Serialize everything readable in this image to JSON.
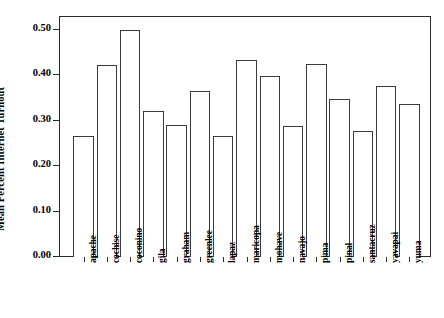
{
  "chart_data": {
    "type": "bar",
    "title": "",
    "xlabel": "",
    "ylabel": "Mean Percent Internet Turnout",
    "ylim": [
      0.0,
      0.53
    ],
    "yticks": [
      "0.00",
      "0.10",
      "0.20",
      "0.30",
      "0.40",
      "0.50"
    ],
    "ytick_values": [
      0.0,
      0.1,
      0.2,
      0.3,
      0.4,
      0.5
    ],
    "grid": false,
    "legend": false,
    "categories": [
      "apache",
      "cochise",
      "coconino",
      "gila",
      "graham",
      "greenlee",
      "lapaz",
      "maricopa",
      "mohave",
      "navajo",
      "pima",
      "pinal",
      "santacruz",
      "yavapai",
      "yuma"
    ],
    "values": [
      0.267,
      0.423,
      0.5,
      0.321,
      0.291,
      0.365,
      0.267,
      0.433,
      0.398,
      0.288,
      0.425,
      0.348,
      0.278,
      0.375,
      0.337
    ],
    "bar_style": {
      "fill": "#ffffff",
      "edge": "#3a3a3a"
    }
  }
}
